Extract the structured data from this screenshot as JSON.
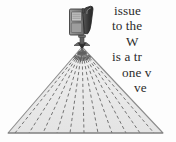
{
  "figure": {
    "caption_present": false,
    "device": {
      "name": "projector-camera-on-stand",
      "body_color": "#8a8a8a",
      "panel_color": "#bdbdbd",
      "handle_color": "#3b3b3b",
      "outline_color": "#444444",
      "stand_color": "#6e6e6e"
    },
    "beam": {
      "name": "projection-fan",
      "shape": "triangle",
      "fill_color": "#e9e9e9",
      "edge_color": "#8d8d8d",
      "ray_color": "#707070",
      "ray_count": 11,
      "apex": {
        "x": 82,
        "y": 47
      },
      "base_left": {
        "x": 8,
        "y": 133
      },
      "base_right": {
        "x": 163,
        "y": 133
      },
      "arc_dash_count": 19,
      "ray_style": "dashed"
    },
    "background_color": "#fdfdfd"
  },
  "text": {
    "color": "#2b2b2b",
    "lines": [
      {
        "content": "issue",
        "indent": 0
      },
      {
        "content": "to the",
        "indent": 1
      },
      {
        "content": "W",
        "indent": 2
      },
      {
        "content": "is a tr",
        "indent": 3
      },
      {
        "content": "one v",
        "indent": 4
      },
      {
        "content": "ve",
        "indent": 5
      }
    ]
  }
}
